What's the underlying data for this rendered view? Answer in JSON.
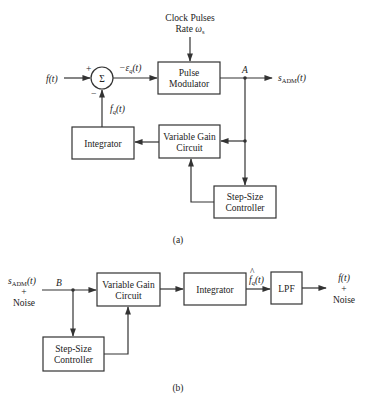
{
  "diagram_a": {
    "caption": "(a)",
    "clock": {
      "line1": "Clock Pulses",
      "line2_prefix": "Rate ",
      "line2_symbol": "ω",
      "line2_sub": "s"
    },
    "input_label": "f(t)",
    "summer": {
      "symbol": "Σ",
      "plus": "+",
      "minus": "−"
    },
    "error_label": {
      "prefix": "−ε",
      "sub": "q",
      "suffix": "(t)"
    },
    "pulse_modulator": {
      "line1": "Pulse",
      "line2": "Modulator"
    },
    "node_label": "A",
    "output_label": {
      "prefix": "s",
      "sub": "ADM",
      "suffix": "(t)"
    },
    "feedback_label": {
      "prefix": "f",
      "sub": "q",
      "suffix": "(t)"
    },
    "integrator": {
      "label": "Integrator"
    },
    "variable_gain": {
      "line1": "Variable Gain",
      "line2": "Circuit"
    },
    "step_size": {
      "line1": "Step-Size",
      "line2": "Controller"
    }
  },
  "diagram_b": {
    "caption": "(b)",
    "input_label": {
      "prefix": "s",
      "sub": "ADM",
      "suffix": "(t)",
      "line2": "+",
      "line3": "Noise"
    },
    "node_label": "B",
    "variable_gain": {
      "line1": "Variable Gain",
      "line2": "Circuit"
    },
    "integrator": {
      "label": "Integrator"
    },
    "mid_label": {
      "hat": "^",
      "prefix": "f",
      "sub": "q",
      "suffix": "(t)"
    },
    "lpf": {
      "label": "LPF"
    },
    "output_label": {
      "line1": "f(t)",
      "line2": "+",
      "line3": "Noise"
    },
    "step_size": {
      "line1": "Step-Size",
      "line2": "Controller"
    }
  }
}
